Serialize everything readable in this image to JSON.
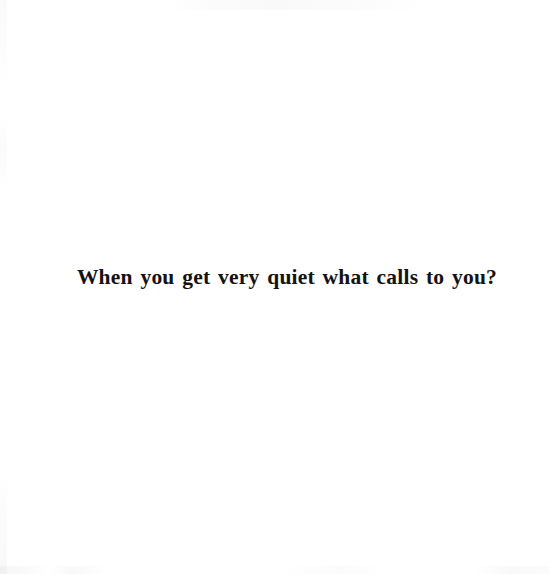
{
  "page": {
    "background_color": "#ffffff",
    "ink_color": "#141212",
    "body": {
      "line": "When you get very quiet what calls to you?"
    }
  }
}
